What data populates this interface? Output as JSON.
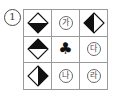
{
  "figure": {
    "item_number": "1",
    "grid": {
      "rows": 3,
      "columns": 3,
      "border_color": "#9a9a9a",
      "background": "#ffffff",
      "cells": [
        {
          "position": "r1c1",
          "type": "diamond",
          "fill": "bottom-half",
          "shape_color": "#111111",
          "label": "diamond-bottom-half-filled"
        },
        {
          "position": "r1c2",
          "type": "circled-glyph",
          "text": "가",
          "shape_color": "#4a4a4a",
          "label": "circled-ga"
        },
        {
          "position": "r1c3",
          "type": "diamond",
          "fill": "left-half",
          "shape_color": "#111111",
          "label": "diamond-left-half-filled"
        },
        {
          "position": "r2c1",
          "type": "diamond",
          "fill": "top-half",
          "shape_color": "#111111",
          "label": "diamond-top-half-filled"
        },
        {
          "position": "r2c2",
          "type": "suit",
          "text": "♣",
          "shape_color": "#111111",
          "label": "club-suit"
        },
        {
          "position": "r2c3",
          "type": "circled-glyph",
          "text": "다",
          "shape_color": "#4a4a4a",
          "label": "circled-da"
        },
        {
          "position": "r3c1",
          "type": "diamond",
          "fill": "right-half",
          "shape_color": "#111111",
          "label": "diamond-right-half-filled"
        },
        {
          "position": "r3c2",
          "type": "circled-glyph",
          "text": "나",
          "shape_color": "#4a4a4a",
          "label": "circled-na"
        },
        {
          "position": "r3c3",
          "type": "circled-glyph",
          "text": "라",
          "shape_color": "#4a4a4a",
          "label": "circled-ra"
        }
      ]
    }
  }
}
